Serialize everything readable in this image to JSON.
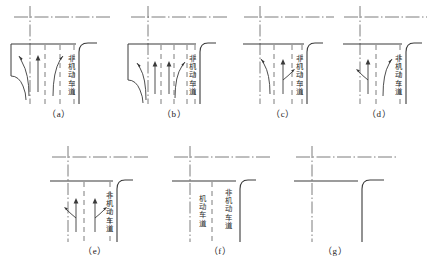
{
  "figure": {
    "title": "",
    "rows": 2,
    "panel_count": 7
  },
  "labels": {
    "nonmotor_lane": "非机动车道",
    "motor_lane": "机动车道"
  },
  "captions": {
    "a": "（a）",
    "b": "（b）",
    "c": "（c）",
    "d": "（d）",
    "e": "（e）",
    "f": "（f）",
    "g": "（g）"
  },
  "colors": {
    "line": "#3a3a3a",
    "dash": "#6d6d6d",
    "centerline": "#5a5a5a",
    "text": "#2b2b2b",
    "background": "#ffffff"
  },
  "panels": [
    {
      "id": "a",
      "caption": "（a）",
      "lane_dividers": 3,
      "arrows": [
        "left-turn",
        "through",
        "right-turn"
      ],
      "edge_labels": [
        "非机动车道"
      ],
      "has_curb_corner": true
    },
    {
      "id": "b",
      "caption": "（b）",
      "lane_dividers": 4,
      "arrows": [
        "left-turn",
        "through",
        "through",
        "right-turn"
      ],
      "edge_labels": [
        "非机动车道"
      ],
      "has_curb_corner": true
    },
    {
      "id": "c",
      "caption": "（c）",
      "lane_dividers": 2,
      "arrows": [
        "left-turn",
        "through-right"
      ],
      "edge_labels": [
        "非机动车道"
      ],
      "has_curb_corner": true
    },
    {
      "id": "d",
      "caption": "（d）",
      "lane_dividers": 2,
      "arrows": [
        "left-through",
        "right-turn"
      ],
      "edge_labels": [
        "非机动车道"
      ],
      "has_curb_corner": true
    },
    {
      "id": "e",
      "caption": "（e）",
      "lane_dividers": 2,
      "arrows": [
        "left-through",
        "through-right"
      ],
      "edge_labels": [
        "非机动车道"
      ],
      "has_curb_corner": true
    },
    {
      "id": "f",
      "caption": "（f）",
      "lane_dividers": 1,
      "arrows": [],
      "edge_labels": [
        "机动车道",
        "非机动车道"
      ],
      "has_curb_corner": true
    },
    {
      "id": "g",
      "caption": "（g）",
      "lane_dividers": 0,
      "arrows": [],
      "edge_labels": [],
      "has_curb_corner": true
    }
  ]
}
